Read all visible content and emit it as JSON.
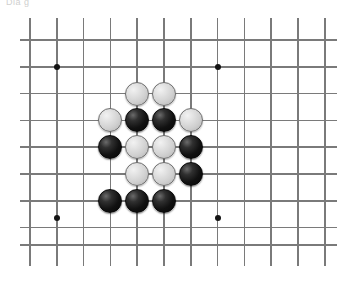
{
  "figure": {
    "caption_fragment": "Dia g"
  },
  "board": {
    "background_color": "#ffffff",
    "line_color": "#7a7a7a",
    "star_point_color": "#141414",
    "white_stone_color": "#cfcfcf",
    "black_stone_color": "#111111",
    "stone_diameter": 24,
    "line_spacing": 26.8,
    "vertical_lines_x": [
      30,
      56.8,
      83.6,
      110.4,
      137.2,
      164,
      190.8,
      217.6,
      244.4,
      271.2,
      298,
      324.8
    ],
    "horizontal_lines_y": [
      40,
      66.8,
      93.6,
      120.4,
      147.2,
      174,
      200.8,
      227.6,
      245
    ],
    "vertical_extent": [
      18,
      266
    ],
    "horizontal_extent": [
      20,
      337
    ],
    "star_points": [
      {
        "x": 56.8,
        "y": 66.8
      },
      {
        "x": 217.6,
        "y": 66.8
      },
      {
        "x": 56.8,
        "y": 217.6
      },
      {
        "x": 217.6,
        "y": 217.6
      }
    ],
    "stones": [
      {
        "color": "white",
        "x": 137.2,
        "y": 93.6,
        "label": "white-stone-1"
      },
      {
        "color": "white",
        "x": 164.0,
        "y": 93.6,
        "label": "white-stone-2"
      },
      {
        "color": "white",
        "x": 110.4,
        "y": 120.4,
        "label": "white-stone-3"
      },
      {
        "color": "black",
        "x": 137.2,
        "y": 120.4,
        "label": "black-stone-1"
      },
      {
        "color": "black",
        "x": 164.0,
        "y": 120.4,
        "label": "black-stone-2"
      },
      {
        "color": "white",
        "x": 190.8,
        "y": 120.4,
        "label": "white-stone-4"
      },
      {
        "color": "black",
        "x": 110.4,
        "y": 147.2,
        "label": "black-stone-3"
      },
      {
        "color": "white",
        "x": 137.2,
        "y": 147.2,
        "label": "white-stone-5"
      },
      {
        "color": "white",
        "x": 164.0,
        "y": 147.2,
        "label": "white-stone-6"
      },
      {
        "color": "black",
        "x": 190.8,
        "y": 147.2,
        "label": "black-stone-4"
      },
      {
        "color": "white",
        "x": 137.2,
        "y": 174.0,
        "label": "white-stone-7"
      },
      {
        "color": "white",
        "x": 164.0,
        "y": 174.0,
        "label": "white-stone-8"
      },
      {
        "color": "black",
        "x": 190.8,
        "y": 174.0,
        "label": "black-stone-5"
      },
      {
        "color": "black",
        "x": 110.4,
        "y": 200.8,
        "label": "black-stone-6"
      },
      {
        "color": "black",
        "x": 137.2,
        "y": 200.8,
        "label": "black-stone-7"
      },
      {
        "color": "black",
        "x": 164.0,
        "y": 200.8,
        "label": "black-stone-8"
      }
    ],
    "counts": {
      "white_stones": 8,
      "black_stones": 8,
      "total_stones": 16
    }
  }
}
